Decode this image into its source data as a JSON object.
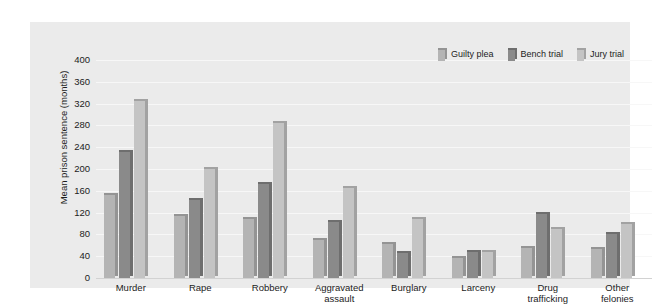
{
  "chart_data": {
    "type": "bar",
    "title": "",
    "subtitle": "",
    "xlabel": "",
    "ylabel": "Mean prison sentence (months)",
    "ylim": [
      0,
      400
    ],
    "ytick_step": 40,
    "yticks": [
      "400",
      "360",
      "320",
      "280",
      "240",
      "200",
      "160",
      "120",
      "80",
      "40",
      "0"
    ],
    "grid": true,
    "legend_position": "top-right",
    "categories": [
      "Murder",
      "Rape",
      "Robbery",
      "Aggravated\nassault",
      "Burglary",
      "Larceny",
      "Drug\ntrafficking",
      "Other\nfelonies"
    ],
    "series": [
      {
        "name": "Guilty plea",
        "color": "#b4b4b4",
        "side_color": "#949494",
        "values": [
          153,
          113,
          108,
          70,
          62,
          36,
          55,
          53
        ]
      },
      {
        "name": "Bench trial",
        "color": "#8a8a8a",
        "side_color": "#6e6e6e",
        "values": [
          232,
          143,
          172,
          103,
          45,
          47,
          118,
          80
        ]
      },
      {
        "name": "Jury trial",
        "color": "#c4c4c4",
        "side_color": "#a2a2a2",
        "values": [
          325,
          200,
          285,
          165,
          108,
          48,
          90,
          100
        ]
      }
    ]
  },
  "colors": {
    "panel_background": "#ebebeb",
    "figure_background": "#ffffff",
    "gridline": "#f7f7f7",
    "axis_line": "#d2d2d2",
    "text": "#1c1c1c"
  }
}
